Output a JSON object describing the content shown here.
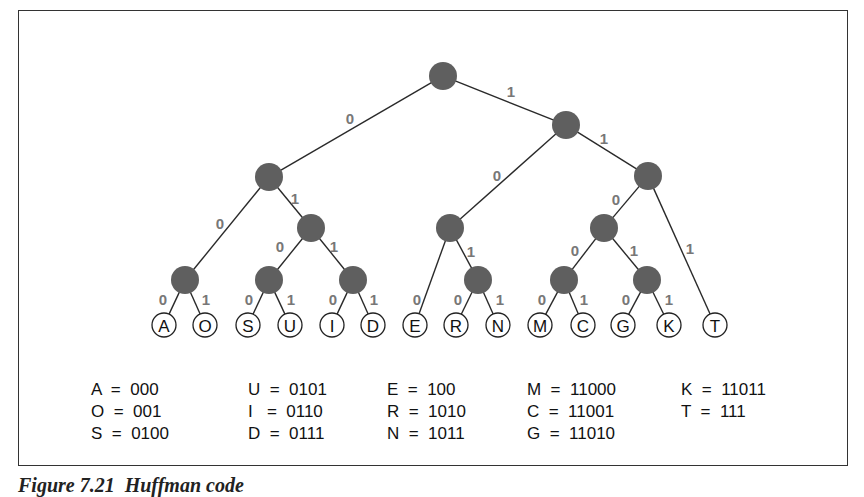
{
  "diagram": {
    "type": "huffman-code-tree",
    "nodes": [
      {
        "id": "root",
        "x": 443,
        "y": 76,
        "type": "inner"
      },
      {
        "id": "n1",
        "x": 566,
        "y": 125,
        "type": "inner"
      },
      {
        "id": "n0",
        "x": 269,
        "y": 177,
        "type": "inner"
      },
      {
        "id": "n11",
        "x": 648,
        "y": 176,
        "type": "inner"
      },
      {
        "id": "n01",
        "x": 311,
        "y": 228,
        "type": "inner"
      },
      {
        "id": "n10",
        "x": 450,
        "y": 228,
        "type": "inner"
      },
      {
        "id": "n110",
        "x": 604,
        "y": 228,
        "type": "inner"
      },
      {
        "id": "n00",
        "x": 185,
        "y": 280,
        "type": "inner"
      },
      {
        "id": "n010",
        "x": 269,
        "y": 280,
        "type": "inner"
      },
      {
        "id": "n011",
        "x": 353,
        "y": 280,
        "type": "inner"
      },
      {
        "id": "n101",
        "x": 478,
        "y": 280,
        "type": "inner"
      },
      {
        "id": "n1100",
        "x": 564,
        "y": 280,
        "type": "inner"
      },
      {
        "id": "n1101",
        "x": 647,
        "y": 280,
        "type": "inner"
      },
      {
        "id": "A",
        "x": 164,
        "y": 325,
        "type": "leaf",
        "label": "A"
      },
      {
        "id": "O",
        "x": 205,
        "y": 325,
        "type": "leaf",
        "label": "O"
      },
      {
        "id": "S",
        "x": 248,
        "y": 325,
        "type": "leaf",
        "label": "S"
      },
      {
        "id": "U",
        "x": 290,
        "y": 325,
        "type": "leaf",
        "label": "U"
      },
      {
        "id": "I",
        "x": 332,
        "y": 325,
        "type": "leaf",
        "label": "I"
      },
      {
        "id": "D",
        "x": 373,
        "y": 325,
        "type": "leaf",
        "label": "D"
      },
      {
        "id": "E",
        "x": 415,
        "y": 325,
        "type": "leaf",
        "label": "E"
      },
      {
        "id": "R",
        "x": 456,
        "y": 325,
        "type": "leaf",
        "label": "R"
      },
      {
        "id": "N",
        "x": 498,
        "y": 325,
        "type": "leaf",
        "label": "N"
      },
      {
        "id": "M",
        "x": 540,
        "y": 325,
        "type": "leaf",
        "label": "M"
      },
      {
        "id": "C",
        "x": 583,
        "y": 325,
        "type": "leaf",
        "label": "C"
      },
      {
        "id": "G",
        "x": 623,
        "y": 325,
        "type": "leaf",
        "label": "G"
      },
      {
        "id": "K",
        "x": 669,
        "y": 325,
        "type": "leaf",
        "label": "K"
      },
      {
        "id": "T",
        "x": 715,
        "y": 325,
        "type": "leaf",
        "label": "T"
      }
    ],
    "edges": [
      {
        "from": "root",
        "to": "n0",
        "bit": "0",
        "lx": 350,
        "ly": 118
      },
      {
        "from": "root",
        "to": "n1",
        "bit": "1",
        "lx": 511,
        "ly": 91
      },
      {
        "from": "n1",
        "to": "n10",
        "bit": "0",
        "lx": 497,
        "ly": 175
      },
      {
        "from": "n1",
        "to": "n11",
        "bit": "1",
        "lx": 604,
        "ly": 138
      },
      {
        "from": "n0",
        "to": "n00",
        "bit": "0",
        "lx": 220,
        "ly": 223
      },
      {
        "from": "n0",
        "to": "n01",
        "bit": "1",
        "lx": 295,
        "ly": 198
      },
      {
        "from": "n01",
        "to": "n010",
        "bit": "0",
        "lx": 280,
        "ly": 246
      },
      {
        "from": "n01",
        "to": "n011",
        "bit": "1",
        "lx": 334,
        "ly": 246
      },
      {
        "from": "n11",
        "to": "n110",
        "bit": "0",
        "lx": 616,
        "ly": 199
      },
      {
        "from": "n11",
        "to": "T",
        "bit": "1",
        "lx": 690,
        "ly": 248
      },
      {
        "from": "n10",
        "to": "E",
        "bit": "0",
        "lx": 417,
        "ly": 299
      },
      {
        "from": "n10",
        "to": "n101",
        "bit": "1",
        "lx": 471,
        "ly": 251
      },
      {
        "from": "n110",
        "to": "n1100",
        "bit": "0",
        "lx": 575,
        "ly": 250
      },
      {
        "from": "n110",
        "to": "n1101",
        "bit": "1",
        "lx": 634,
        "ly": 250
      },
      {
        "from": "n00",
        "to": "A",
        "bit": "0",
        "lx": 163,
        "ly": 299
      },
      {
        "from": "n00",
        "to": "O",
        "bit": "1",
        "lx": 206,
        "ly": 299
      },
      {
        "from": "n010",
        "to": "S",
        "bit": "0",
        "lx": 249,
        "ly": 299
      },
      {
        "from": "n010",
        "to": "U",
        "bit": "1",
        "lx": 291,
        "ly": 299
      },
      {
        "from": "n011",
        "to": "I",
        "bit": "0",
        "lx": 333,
        "ly": 299
      },
      {
        "from": "n011",
        "to": "D",
        "bit": "1",
        "lx": 374,
        "ly": 299
      },
      {
        "from": "n101",
        "to": "R",
        "bit": "0",
        "lx": 458,
        "ly": 299
      },
      {
        "from": "n101",
        "to": "N",
        "bit": "1",
        "lx": 500,
        "ly": 299
      },
      {
        "from": "n1100",
        "to": "M",
        "bit": "0",
        "lx": 542,
        "ly": 299
      },
      {
        "from": "n1100",
        "to": "C",
        "bit": "1",
        "lx": 584,
        "ly": 299
      },
      {
        "from": "n1101",
        "to": "G",
        "bit": "0",
        "lx": 626,
        "ly": 299
      },
      {
        "from": "n1101",
        "to": "K",
        "bit": "1",
        "lx": 669,
        "ly": 299
      }
    ],
    "colors": {
      "inner_node": "#5f5f5f",
      "edge": "#2a2a2a",
      "bit_label": "#777777",
      "border": "#333333"
    }
  },
  "code_table": {
    "columns": [
      {
        "x": 0,
        "rows": [
          "A  =  000",
          "O  =  001",
          "S  =  0100"
        ]
      },
      {
        "x": 157,
        "rows": [
          "U  =  0101",
          "I   =  0110",
          "D  =  0111"
        ]
      },
      {
        "x": 296,
        "rows": [
          "E  =  100",
          "R  =  1010",
          "N  =  1011"
        ]
      },
      {
        "x": 436,
        "rows": [
          "M  =  11000",
          "C  =  11001",
          "G  =  11010"
        ]
      },
      {
        "x": 590,
        "rows": [
          "K  =  11011",
          "T  =  111"
        ]
      }
    ]
  },
  "caption": "Figure 7.21  Huffman code"
}
